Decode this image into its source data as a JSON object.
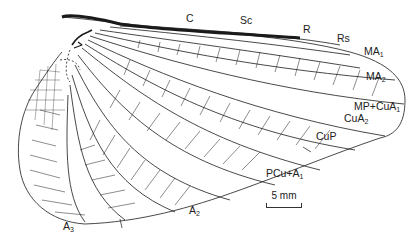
{
  "figure": {
    "line_color": "#1a1a1a",
    "background": "#ffffff"
  },
  "labels": {
    "C": {
      "main": "C",
      "sub": ""
    },
    "Sc": {
      "main": "Sc",
      "sub": ""
    },
    "R": {
      "main": "R",
      "sub": ""
    },
    "Rs": {
      "main": "Rs",
      "sub": ""
    },
    "MA1": {
      "main": "MA",
      "sub": "1"
    },
    "MA2": {
      "main": "MA",
      "sub": "2"
    },
    "MPCuA1": {
      "main": "MP+CuA",
      "sub": "1"
    },
    "CuA2": {
      "main": "CuA",
      "sub": "2"
    },
    "CuP": {
      "main": "CuP",
      "sub": ""
    },
    "PCuA1": {
      "main": "PCu+A",
      "sub": "1"
    },
    "A2": {
      "main": "A",
      "sub": "2"
    },
    "A3": {
      "main": "A",
      "sub": "3"
    }
  },
  "scale_bar": {
    "label": "5 mm"
  }
}
